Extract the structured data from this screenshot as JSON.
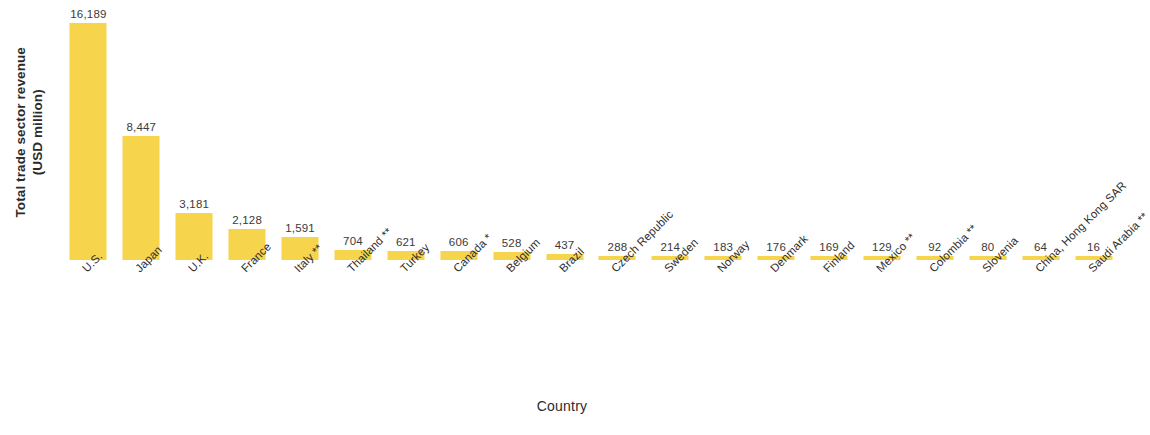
{
  "chart_data": {
    "type": "bar",
    "title": "",
    "subtitle": "",
    "xlabel": "Country",
    "ylabel": "Total trade sector revenue (USD million)",
    "ylabel_lines": [
      "Total trade sector revenue",
      "(USD million)"
    ],
    "grid": false,
    "legend": "none",
    "axis_ticks_visible": false,
    "ylim": [
      0,
      16189
    ],
    "bar_color": "#F6D44B",
    "value_label_color": "#3A3A3A",
    "categories": [
      "U.S.",
      "Japan",
      "U.K.",
      "France",
      "Italy **",
      "Thailand **",
      "Turkey",
      "Canada *",
      "Belgium",
      "Brazil",
      "Czech Republic",
      "Sweden",
      "Norway",
      "Denmark",
      "Finland",
      "Mexico **",
      "Colombia **",
      "Slovenia",
      "China, Hong Kong SAR",
      "Saudi Arabia **"
    ],
    "values": [
      16189,
      8447,
      3181,
      2128,
      1591,
      704,
      621,
      606,
      528,
      437,
      288,
      214,
      183,
      176,
      169,
      129,
      92,
      80,
      64,
      16
    ],
    "value_labels": [
      "16,189",
      "8,447",
      "3,181",
      "2,128",
      "1,591",
      "704",
      "621",
      "606",
      "528",
      "437",
      "288",
      "214",
      "183",
      "176",
      "169",
      "129",
      "92",
      "80",
      "64",
      "16"
    ]
  }
}
